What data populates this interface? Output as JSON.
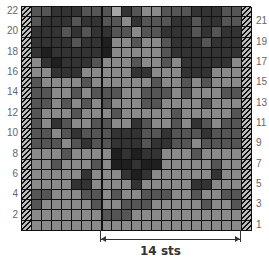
{
  "chart": {
    "title": "",
    "repeat_label": "14 sts",
    "row_numbers_left": [
      "22",
      "20",
      "18",
      "16",
      "14",
      "12",
      "10",
      "8",
      "6",
      "4",
      "2"
    ],
    "row_numbers_right": [
      "21",
      "19",
      "17",
      "15",
      "13",
      "11",
      "9",
      "7",
      "5",
      "3",
      "1"
    ],
    "shades": {
      "0": "#1f1f1f",
      "1": "#333333",
      "2": "#555555",
      "3": "#8a8a8a",
      "4": "#a6a6a6"
    },
    "rows_top_to_bottom": [
      [
        2,
        2,
        1,
        1,
        1,
        2,
        2,
        2,
        4,
        1,
        2,
        3,
        3,
        2,
        2,
        2,
        1,
        1,
        1,
        2,
        2
      ],
      [
        2,
        1,
        1,
        1,
        2,
        1,
        1,
        2,
        2,
        3,
        1,
        2,
        2,
        2,
        1,
        1,
        2,
        1,
        1,
        2,
        2
      ],
      [
        1,
        1,
        1,
        2,
        1,
        2,
        1,
        1,
        2,
        2,
        3,
        2,
        2,
        1,
        1,
        1,
        2,
        1,
        2,
        1,
        1
      ],
      [
        1,
        1,
        1,
        1,
        2,
        1,
        1,
        0,
        3,
        3,
        2,
        3,
        3,
        2,
        1,
        1,
        1,
        2,
        1,
        1,
        1
      ],
      [
        1,
        0,
        1,
        1,
        1,
        1,
        1,
        0,
        3,
        3,
        3,
        3,
        3,
        2,
        1,
        1,
        1,
        1,
        1,
        1,
        1
      ],
      [
        3,
        1,
        0,
        1,
        1,
        1,
        2,
        3,
        3,
        3,
        2,
        3,
        3,
        2,
        3,
        1,
        1,
        1,
        1,
        1,
        3
      ],
      [
        3,
        3,
        1,
        1,
        1,
        3,
        3,
        3,
        3,
        3,
        1,
        1,
        3,
        3,
        3,
        1,
        1,
        1,
        3,
        3,
        3
      ],
      [
        2,
        3,
        3,
        3,
        3,
        2,
        3,
        3,
        3,
        3,
        3,
        3,
        2,
        3,
        3,
        2,
        3,
        2,
        3,
        3,
        3
      ],
      [
        2,
        2,
        3,
        3,
        2,
        3,
        2,
        2,
        2,
        3,
        3,
        2,
        2,
        2,
        3,
        2,
        3,
        3,
        3,
        2,
        2
      ],
      [
        2,
        2,
        3,
        2,
        3,
        2,
        3,
        2,
        3,
        3,
        3,
        2,
        2,
        3,
        3,
        3,
        3,
        2,
        3,
        3,
        3
      ],
      [
        2,
        3,
        3,
        3,
        2,
        3,
        3,
        3,
        2,
        3,
        3,
        3,
        3,
        3,
        2,
        3,
        3,
        3,
        3,
        3,
        2
      ],
      [
        2,
        3,
        1,
        2,
        3,
        3,
        2,
        2,
        3,
        3,
        1,
        2,
        3,
        3,
        2,
        3,
        1,
        2,
        3,
        2,
        2
      ],
      [
        2,
        2,
        3,
        2,
        1,
        2,
        2,
        2,
        1,
        1,
        1,
        2,
        2,
        1,
        2,
        2,
        2,
        1,
        2,
        2,
        2
      ],
      [
        2,
        2,
        2,
        3,
        2,
        1,
        2,
        2,
        1,
        1,
        1,
        2,
        1,
        1,
        2,
        2,
        3,
        2,
        2,
        2,
        2
      ],
      [
        3,
        3,
        3,
        2,
        3,
        3,
        3,
        3,
        0,
        1,
        0,
        1,
        1,
        3,
        3,
        3,
        2,
        3,
        3,
        3,
        3
      ],
      [
        3,
        3,
        2,
        3,
        3,
        3,
        2,
        3,
        0,
        0,
        1,
        0,
        0,
        3,
        3,
        3,
        3,
        3,
        2,
        3,
        3
      ],
      [
        3,
        3,
        3,
        3,
        3,
        1,
        3,
        3,
        3,
        1,
        0,
        1,
        3,
        3,
        3,
        3,
        3,
        3,
        1,
        3,
        3
      ],
      [
        3,
        3,
        3,
        3,
        1,
        1,
        3,
        3,
        3,
        3,
        1,
        3,
        3,
        3,
        3,
        3,
        1,
        1,
        3,
        3,
        3
      ],
      [
        2,
        2,
        3,
        3,
        3,
        2,
        2,
        3,
        2,
        3,
        3,
        2,
        2,
        2,
        3,
        3,
        2,
        3,
        3,
        2,
        2
      ],
      [
        2,
        3,
        3,
        3,
        3,
        3,
        2,
        3,
        3,
        2,
        2,
        2,
        3,
        3,
        3,
        3,
        3,
        2,
        3,
        3,
        2
      ],
      [
        3,
        3,
        3,
        3,
        3,
        3,
        3,
        2,
        2,
        2,
        3,
        3,
        3,
        3,
        3,
        3,
        3,
        3,
        3,
        3,
        3
      ],
      [
        3,
        3,
        3,
        3,
        3,
        3,
        3,
        3,
        3,
        3,
        3,
        3,
        3,
        3,
        3,
        3,
        3,
        3,
        3,
        3,
        3
      ]
    ]
  }
}
